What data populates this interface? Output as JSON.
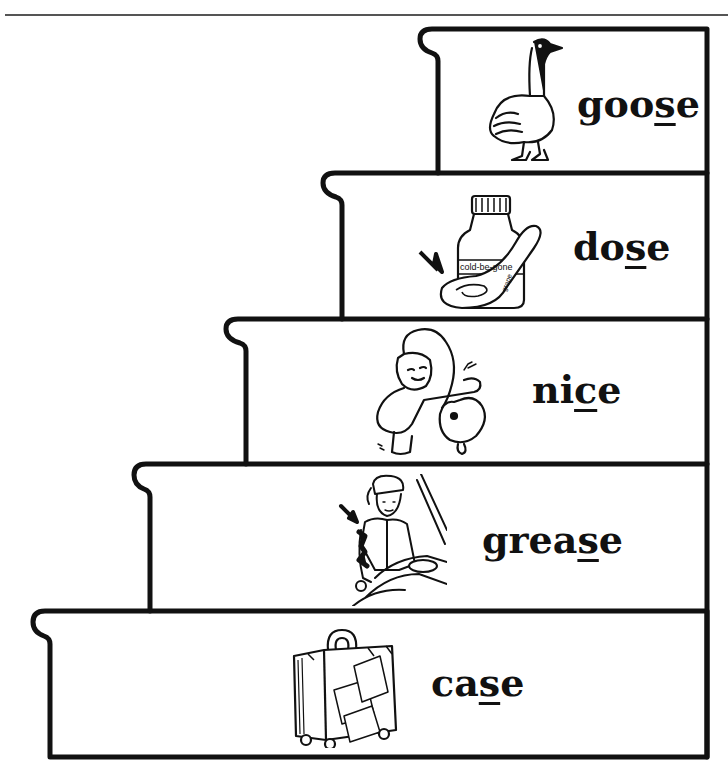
{
  "worksheet": {
    "title": "",
    "steps": [
      {
        "word_pre": "goo",
        "word_target": "s",
        "word_post": "e",
        "full_word": "goose",
        "picture": "goose-icon"
      },
      {
        "word_pre": "do",
        "word_target": "s",
        "word_post": "e",
        "full_word": "dose",
        "picture": "medicine-bottle-spoon-icon",
        "bottle_label": "cold-be-gone",
        "spoon_label_1": "grape",
        "spoon_label_2": "flavor"
      },
      {
        "word_pre": "ni",
        "word_target": "c",
        "word_post": "e",
        "full_word": "nice",
        "picture": "girl-petting-dog-icon"
      },
      {
        "word_pre": "grea",
        "word_target": "s",
        "word_post": "e",
        "full_word": "grease",
        "picture": "mechanic-car-icon"
      },
      {
        "word_pre": "ca",
        "word_target": "s",
        "word_post": "e",
        "full_word": "case",
        "picture": "suitcase-icon"
      }
    ]
  },
  "colors": {
    "ink": "#111111",
    "paper": "#ffffff",
    "rule": "#555555"
  }
}
